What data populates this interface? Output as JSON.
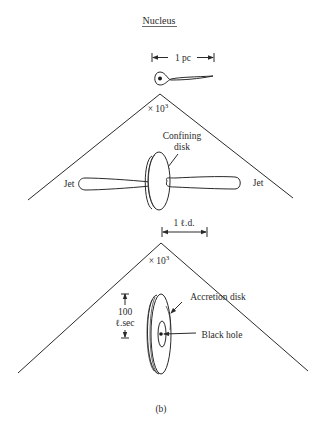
{
  "figure": {
    "title": "Nucleus",
    "caption": "(b)",
    "stages": [
      {
        "id": "nucleus",
        "scale_label": "1 pc",
        "description": "nucleus with tail"
      },
      {
        "id": "jets",
        "zoom_label": "× 10",
        "zoom_exp": "3",
        "labels": {
          "disk": [
            "Confining",
            "disk"
          ],
          "jet_left": "Jet",
          "jet_right": "Jet"
        },
        "scale_label": "1 ℓ.d."
      },
      {
        "id": "accretion",
        "zoom_label": "× 10",
        "zoom_exp": "3",
        "labels": {
          "accretion_disk": "Accretion disk",
          "black_hole": "Black hole",
          "height_value": "100",
          "height_unit": "ℓ.sec"
        }
      }
    ]
  }
}
